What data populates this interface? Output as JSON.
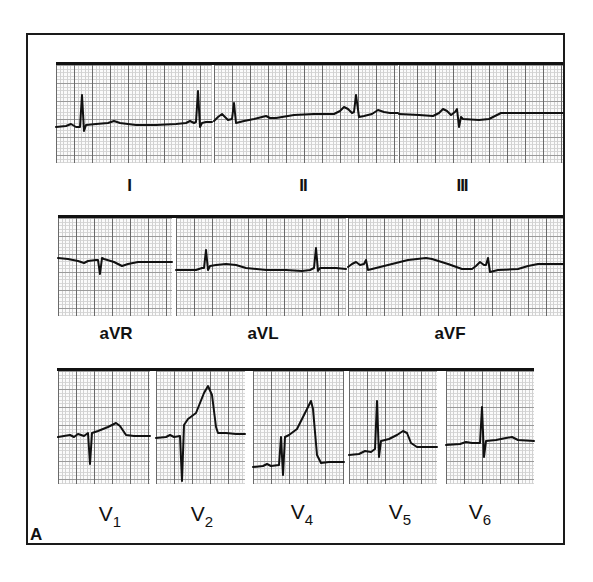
{
  "figure": {
    "panel_letter": "A",
    "rows": [
      {
        "leads": [
          {
            "name": "I",
            "label": "I"
          },
          {
            "name": "II",
            "label": "II"
          },
          {
            "name": "III",
            "label": "III"
          }
        ]
      },
      {
        "leads": [
          {
            "name": "aVR",
            "label": "aVR"
          },
          {
            "name": "aVL",
            "label": "aVL"
          },
          {
            "name": "aVF",
            "label": "aVF"
          }
        ]
      },
      {
        "leads": [
          {
            "name": "V1",
            "label": "V",
            "sub": "1"
          },
          {
            "name": "V2",
            "label": "V",
            "sub": "2"
          },
          {
            "name": "V4",
            "label": "V",
            "sub": "4"
          },
          {
            "name": "V5",
            "label": "V",
            "sub": "5"
          },
          {
            "name": "V6",
            "label": "V",
            "sub": "6"
          }
        ]
      }
    ]
  },
  "colors": {
    "trace": "#111111",
    "grid_major": "#6a6a6a",
    "grid_minor": "#d2d2d2",
    "background": "#ffffff"
  }
}
